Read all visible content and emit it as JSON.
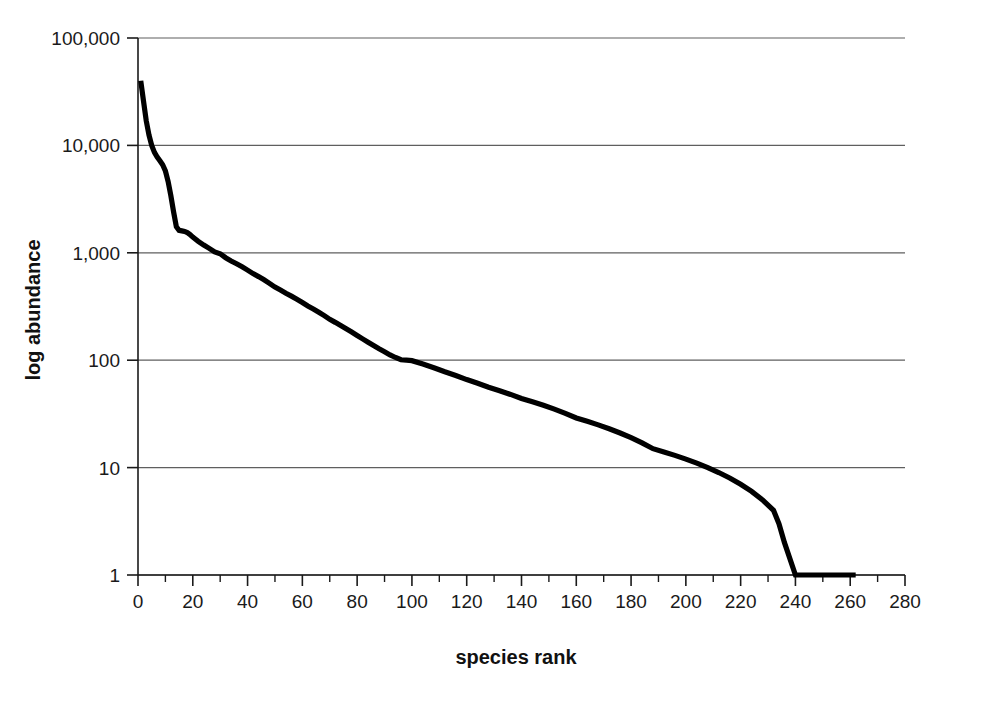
{
  "figure": {
    "background_color": "#ffffff",
    "series_color": "#000000",
    "grid_color": "#5f5f5f",
    "axis_color": "#1a1a1a"
  },
  "chart_data": {
    "type": "line",
    "title": "",
    "subtitle": "",
    "xlabel": "species rank",
    "ylabel": "log abundance",
    "yscale": "log",
    "xscale": "linear",
    "xlim": [
      0,
      280
    ],
    "ylim": [
      1,
      100000
    ],
    "grid": "horizontal",
    "legend": "none",
    "annotations": [],
    "xticks": [
      0,
      20,
      40,
      60,
      80,
      100,
      120,
      140,
      160,
      180,
      200,
      220,
      240,
      260,
      280
    ],
    "xtick_labels": [
      "0",
      "20",
      "40",
      "60",
      "80",
      "100",
      "120",
      "140",
      "160",
      "180",
      "200",
      "220",
      "240",
      "260",
      "280"
    ],
    "xminor_ticks": [
      10,
      30,
      50,
      70,
      90,
      110,
      130,
      150,
      170,
      190,
      210,
      230,
      250,
      270
    ],
    "yticks": [
      1,
      10,
      100,
      1000,
      10000,
      100000
    ],
    "ytick_labels": [
      "1",
      "10",
      "100",
      "1,000",
      "10,000",
      "100,000"
    ],
    "series": [
      {
        "name": "rank abundance",
        "x": [
          1,
          2,
          3,
          4,
          5,
          6,
          7,
          8,
          9,
          10,
          11,
          12,
          13,
          14,
          15,
          16,
          17,
          18,
          19,
          20,
          22,
          24,
          26,
          28,
          30,
          32,
          34,
          36,
          38,
          40,
          42,
          44,
          46,
          48,
          50,
          52,
          54,
          56,
          58,
          60,
          62,
          64,
          66,
          68,
          70,
          72,
          74,
          76,
          78,
          80,
          82,
          84,
          86,
          88,
          90,
          92,
          94,
          96,
          98,
          100,
          104,
          108,
          112,
          116,
          120,
          124,
          128,
          132,
          136,
          140,
          144,
          148,
          152,
          156,
          160,
          164,
          168,
          172,
          176,
          180,
          184,
          188,
          192,
          196,
          200,
          204,
          208,
          212,
          216,
          220,
          224,
          228,
          232,
          234,
          236,
          240,
          246,
          252,
          258,
          262
        ],
        "values": [
          40000,
          26000,
          17000,
          12500,
          10000,
          8600,
          7800,
          7200,
          6600,
          5800,
          4600,
          3400,
          2400,
          1750,
          1620,
          1600,
          1580,
          1540,
          1480,
          1400,
          1280,
          1180,
          1100,
          1020,
          980,
          900,
          840,
          790,
          740,
          690,
          640,
          600,
          560,
          520,
          480,
          450,
          420,
          395,
          370,
          345,
          320,
          300,
          280,
          260,
          240,
          225,
          210,
          196,
          183,
          170,
          158,
          147,
          137,
          128,
          120,
          112,
          106,
          101,
          100,
          99,
          92,
          85,
          78,
          72,
          66,
          61,
          56,
          52,
          48,
          44,
          41,
          38,
          35,
          32,
          29,
          27,
          25,
          23,
          21,
          19,
          17,
          15,
          14,
          13,
          12,
          11,
          10,
          9,
          8,
          7,
          6,
          5,
          4,
          3,
          2,
          1,
          1,
          1,
          1,
          1
        ]
      }
    ]
  },
  "axes": {
    "y_axis_title": "log abundance",
    "x_axis_title": "species rank"
  }
}
